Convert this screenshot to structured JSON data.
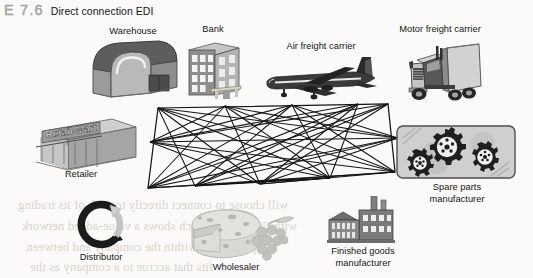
{
  "caption": {
    "figure_number": "E 7.6",
    "title": "Direct connection EDI"
  },
  "diagram": {
    "type": "mesh-network",
    "node_count": 10,
    "link_style": "complete-graph",
    "line_color": "#151515"
  },
  "entities": [
    {
      "id": "warehouse",
      "label": "Warehouse",
      "icon": "warehouse-icon",
      "x": 133,
      "y": 33
    },
    {
      "id": "bank",
      "label": "Bank",
      "icon": "bank-building-icon",
      "x": 213,
      "y": 31
    },
    {
      "id": "air-freight",
      "label": "Air freight carrier",
      "icon": "airplane-icon",
      "x": 311,
      "y": 48
    },
    {
      "id": "motor-freight",
      "label": "Motor freight carrier",
      "icon": "semi-truck-icon",
      "x": 440,
      "y": 31
    },
    {
      "id": "retailer",
      "label": "Retailer",
      "icon": "retail-store-icon",
      "x": 81,
      "y": 177
    },
    {
      "id": "distributor",
      "label": "Distributor",
      "icon": "circular-arrows-icon",
      "x": 101,
      "y": 258
    },
    {
      "id": "wholesaler",
      "label": "Wholesaler",
      "icon": "cheese-grapes-icon",
      "x": 236,
      "y": 268
    },
    {
      "id": "finished-goods",
      "label": "Finished goods\nmanufacturer",
      "icon": "factory-icon",
      "x": 363,
      "y": 250
    },
    {
      "id": "spare-parts",
      "label": "Spare parts\nmanufacturer",
      "icon": "gears-panel-icon",
      "x": 452,
      "y": 188
    }
  ],
  "store_sign": "Retail-Mart",
  "ghost_text": [
    {
      "text": "will choose to connect directly to each of its trading",
      "x": 18,
      "y": 198
    },
    {
      "text": "with Figure 7.7, which shows a value-added network",
      "x": 22,
      "y": 219
    },
    {
      "text": "paper flow within the company and between",
      "x": 26,
      "y": 240
    },
    {
      "text": "fits that accrue to a company as the",
      "x": 30,
      "y": 260
    }
  ],
  "colors": {
    "page_background": "#fbfaf8",
    "ink": "#151515",
    "caption_number": "#a9a9a9",
    "ghost": "#d8d2c9"
  }
}
